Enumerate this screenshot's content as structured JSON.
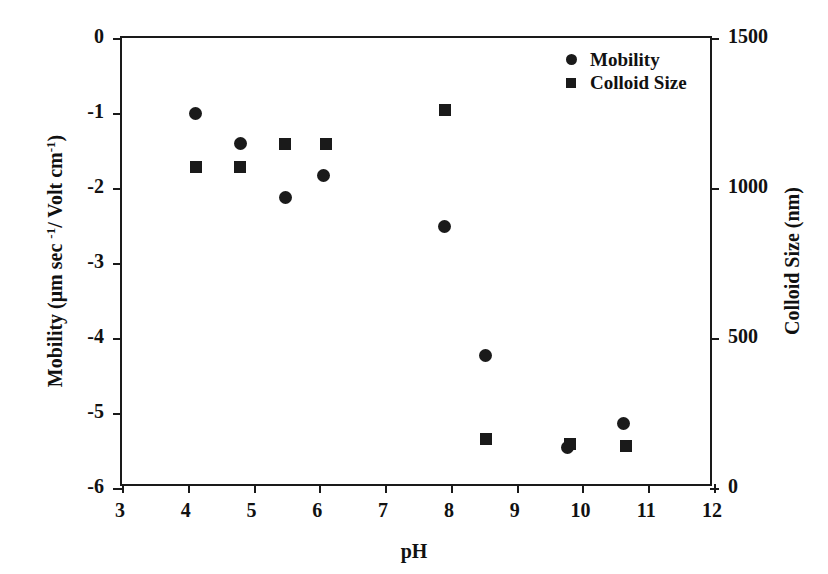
{
  "chart_data": {
    "type": "scatter",
    "title": "",
    "xlabel": "pH",
    "ylabel": "Mobility (μm sec -1/ Volt cm-1)",
    "y2label": "Colloid Size (nm)",
    "xlim": [
      3,
      12
    ],
    "ylim": [
      -6,
      0
    ],
    "y2lim": [
      0,
      1500
    ],
    "grid": false,
    "legend_position": "top-right",
    "xticks": [
      3,
      4,
      5,
      6,
      7,
      8,
      9,
      10,
      11,
      12
    ],
    "xticklabels": [
      "3",
      "4",
      "5",
      "6",
      "7",
      "8",
      "9",
      "10",
      "11",
      "12"
    ],
    "yticks": [
      0,
      -1,
      -2,
      -3,
      -4,
      -5,
      -6
    ],
    "yticklabels": [
      "0",
      "-1",
      "-2",
      "-3",
      "-4",
      "-5",
      "-6"
    ],
    "y2ticks": [
      1500,
      1000,
      500,
      0
    ],
    "y2ticklabels": [
      "1500",
      "1000",
      "500",
      "0"
    ],
    "series": [
      {
        "name": "Mobility",
        "marker": "circle",
        "axis": "left",
        "color": "#1a1a1a",
        "points": [
          {
            "x": 4.12,
            "y": -1.0
          },
          {
            "x": 4.8,
            "y": -1.41
          },
          {
            "x": 5.48,
            "y": -2.13
          },
          {
            "x": 6.07,
            "y": -1.83
          },
          {
            "x": 7.91,
            "y": -2.51
          },
          {
            "x": 8.53,
            "y": -4.23
          },
          {
            "x": 9.78,
            "y": -5.46
          },
          {
            "x": 10.63,
            "y": -5.14
          }
        ]
      },
      {
        "name": "Colloid Size",
        "marker": "square",
        "axis": "right",
        "color": "#1a1a1a",
        "points": [
          {
            "x": 4.12,
            "y": 1070
          },
          {
            "x": 4.8,
            "y": 1070
          },
          {
            "x": 5.48,
            "y": 1147
          },
          {
            "x": 6.1,
            "y": 1147
          },
          {
            "x": 7.91,
            "y": 1260
          },
          {
            "x": 8.53,
            "y": 163
          },
          {
            "x": 9.81,
            "y": 147
          },
          {
            "x": 10.66,
            "y": 140
          }
        ]
      }
    ],
    "legend": [
      {
        "label": "Mobility",
        "marker": "circle"
      },
      {
        "label": "Colloid Size",
        "marker": "square"
      }
    ]
  },
  "ylabel_parts": {
    "a": "Mobility (μm sec ",
    "b": "-1",
    "c": "/ Volt cm",
    "d": "-1",
    "e": ")"
  }
}
